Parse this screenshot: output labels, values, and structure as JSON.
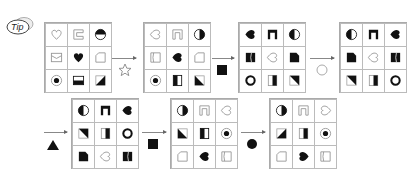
{
  "badge": {
    "label": "Tip"
  },
  "colors": {
    "line": "#aaaaaa",
    "fill": "#111111",
    "faint": "#bbbbbb"
  },
  "grids": [
    {
      "id": 1,
      "cells": [
        "heart-outline",
        "bracket-outline",
        "semicircle-top-fill",
        "envelope-outline",
        "heart-fill",
        "folded-corner-outline",
        "dot-in-circle",
        "rect-bottom-fill",
        "triangle-br-fill"
      ]
    },
    {
      "id": 2,
      "cells": [
        "heart-left-outline",
        "arch-outline",
        "circle-right-fill",
        "cut-rect-outline",
        "heart-left-fill",
        "folded-corner-outline",
        "dot-in-circle",
        "rect-left-fill",
        "triangle-bl-fill"
      ]
    },
    {
      "id": 3,
      "cells": [
        "heart-left-fill",
        "arch-fill",
        "circle-left-fill",
        "cut-rect-fill",
        "heart-left-outline",
        "folded-corner-fill",
        "ring-bold",
        "rect-right-fill",
        "triangle-tr-fill"
      ]
    },
    {
      "id": 4,
      "cells": [
        "circle-left-fill",
        "arch-fill",
        "heart-left-fill",
        "folded-corner-fill",
        "heart-left-outline",
        "cut-rect-fill",
        "triangle-tr-fill",
        "rect-right-fill",
        "ring-bold"
      ]
    },
    {
      "id": 5,
      "cells": [
        "circle-left-fill",
        "arch-fill",
        "heart-left-fill",
        "triangle-tr-fill",
        "rect-right-fill",
        "ring-bold",
        "folded-corner-fill",
        "heart-left-outline",
        "cut-rect-fill"
      ]
    },
    {
      "id": 6,
      "cells": [
        "circle-right-fill",
        "arch-outline",
        "heart-left-outline",
        "triangle-bl-fill",
        "rect-left-fill",
        "dot-in-circle",
        "folded-corner-outline",
        "heart-left-fill",
        "cut-rect-outline"
      ]
    },
    {
      "id": 7,
      "cells": [
        "circle-right-fill",
        "arch-outline",
        "heart-right-outline",
        "triangle-br-fill",
        "rect-right-fill",
        "dot-in-circle",
        "folded-corner-outline",
        "heart-right-fill",
        "cut-rect-outline"
      ]
    }
  ],
  "operators": [
    {
      "symbol": "star-outline",
      "meaning": "step 1"
    },
    {
      "symbol": "square-fill",
      "meaning": "step 2"
    },
    {
      "symbol": "circle-outline",
      "meaning": "step 3"
    },
    {
      "symbol": "triangle-fill",
      "meaning": "step 4"
    },
    {
      "symbol": "square-fill",
      "meaning": "step 5"
    },
    {
      "symbol": "circle-fill",
      "meaning": "step 6"
    }
  ]
}
